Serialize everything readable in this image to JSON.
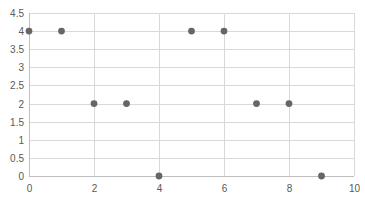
{
  "chart_data": {
    "type": "scatter",
    "title": "",
    "xlabel": "",
    "ylabel": "",
    "xlim": [
      0,
      10
    ],
    "ylim": [
      0,
      4.5
    ],
    "x_ticks": [
      0,
      2,
      4,
      6,
      8,
      10
    ],
    "y_ticks": [
      0,
      0.5,
      1,
      1.5,
      2,
      2.5,
      3,
      3.5,
      4,
      4.5
    ],
    "x_tick_labels": [
      "0",
      "2",
      "4",
      "6",
      "8",
      "10"
    ],
    "y_tick_labels": [
      "0",
      "0.5",
      "1",
      "1.5",
      "2",
      "2.5",
      "3",
      "3.5",
      "4",
      "4.5"
    ],
    "grid": true,
    "legend": null,
    "series": [
      {
        "name": "Series1",
        "color": "#666666",
        "x": [
          0,
          1,
          2,
          3,
          4,
          5,
          6,
          7,
          8,
          9
        ],
        "y": [
          4,
          4,
          2,
          2,
          0,
          4,
          4,
          2,
          2,
          0
        ]
      }
    ]
  }
}
